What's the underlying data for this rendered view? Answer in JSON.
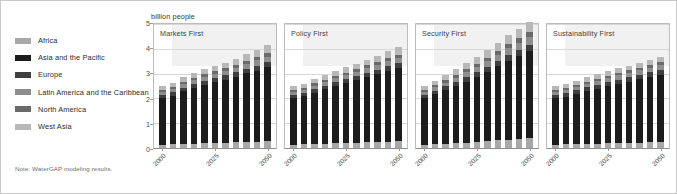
{
  "figure": {
    "axis_title": "billion people",
    "note": "Note: WaterGAP modeling results."
  },
  "legend": {
    "items": [
      {
        "label": "Africa",
        "color": "#a8a8a8"
      },
      {
        "label": "Asia and the Pacific",
        "color": "#1c1c1c"
      },
      {
        "label": "Europe",
        "color": "#3f3f3f"
      },
      {
        "label": "Latin America and the Caribbean",
        "color": "#8e8e8e"
      },
      {
        "label": "North America",
        "color": "#6a6a6a"
      },
      {
        "label": "West Asia",
        "color": "#b8b8b8"
      }
    ]
  },
  "chart_data": {
    "type": "bar",
    "title": "",
    "subtitle": "",
    "xlabel": "",
    "ylabel": "billion people",
    "ylim": [
      0,
      5
    ],
    "yticks": [
      0,
      1,
      2,
      3,
      4,
      5
    ],
    "grid": true,
    "legend_position": "left",
    "stacked": true,
    "x": [
      2000,
      2005,
      2010,
      2015,
      2020,
      2025,
      2030,
      2035,
      2040,
      2045,
      2050
    ],
    "xtick_labels": [
      "2000",
      "2025",
      "2050"
    ],
    "xtick_positions": [
      2000,
      2025,
      2050
    ],
    "series_names": [
      "Africa",
      "Asia and the Pacific",
      "Europe",
      "Latin America and the Caribbean",
      "North America",
      "West Asia"
    ],
    "panels": [
      {
        "title": "Markets First",
        "totals": [
          2.5,
          2.62,
          2.85,
          3.02,
          3.18,
          3.32,
          3.45,
          3.6,
          3.78,
          3.95,
          4.15
        ],
        "series": [
          {
            "name": "Africa",
            "values": [
              0.14,
              0.15,
              0.17,
              0.18,
              0.2,
              0.21,
              0.22,
              0.23,
              0.25,
              0.26,
              0.28
            ]
          },
          {
            "name": "Asia and the Pacific",
            "values": [
              1.86,
              1.95,
              2.12,
              2.25,
              2.36,
              2.46,
              2.54,
              2.64,
              2.76,
              2.86,
              2.98
            ]
          },
          {
            "name": "Europe",
            "values": [
              0.14,
              0.14,
              0.15,
              0.15,
              0.16,
              0.16,
              0.17,
              0.18,
              0.19,
              0.2,
              0.21
            ]
          },
          {
            "name": "Latin America and the Caribbean",
            "values": [
              0.12,
              0.13,
              0.14,
              0.15,
              0.16,
              0.17,
              0.18,
              0.19,
              0.2,
              0.21,
              0.22
            ]
          },
          {
            "name": "North America",
            "values": [
              0.08,
              0.08,
              0.09,
              0.09,
              0.1,
              0.1,
              0.11,
              0.11,
              0.12,
              0.13,
              0.14
            ]
          },
          {
            "name": "West Asia",
            "values": [
              0.16,
              0.17,
              0.18,
              0.2,
              0.2,
              0.22,
              0.23,
              0.25,
              0.26,
              0.29,
              0.32
            ]
          }
        ]
      },
      {
        "title": "Policy First",
        "totals": [
          2.5,
          2.6,
          2.78,
          2.95,
          3.1,
          3.25,
          3.4,
          3.55,
          3.72,
          3.9,
          4.08
        ],
        "series": [
          {
            "name": "Africa",
            "values": [
              0.14,
              0.15,
              0.16,
              0.17,
              0.19,
              0.2,
              0.21,
              0.23,
              0.24,
              0.26,
              0.27
            ]
          },
          {
            "name": "Asia and the Pacific",
            "values": [
              1.86,
              1.94,
              2.07,
              2.2,
              2.3,
              2.41,
              2.52,
              2.62,
              2.73,
              2.85,
              2.95
            ]
          },
          {
            "name": "Europe",
            "values": [
              0.14,
              0.14,
              0.15,
              0.15,
              0.16,
              0.16,
              0.17,
              0.18,
              0.19,
              0.19,
              0.2
            ]
          },
          {
            "name": "Latin America and the Caribbean",
            "values": [
              0.12,
              0.13,
              0.14,
              0.15,
              0.16,
              0.17,
              0.18,
              0.19,
              0.2,
              0.21,
              0.22
            ]
          },
          {
            "name": "North America",
            "values": [
              0.08,
              0.08,
              0.09,
              0.09,
              0.1,
              0.1,
              0.11,
              0.11,
              0.12,
              0.13,
              0.13
            ]
          },
          {
            "name": "West Asia",
            "values": [
              0.16,
              0.16,
              0.17,
              0.19,
              0.19,
              0.21,
              0.21,
              0.22,
              0.24,
              0.26,
              0.31
            ]
          }
        ]
      },
      {
        "title": "Security First",
        "totals": [
          2.5,
          2.72,
          2.95,
          3.18,
          3.42,
          3.68,
          3.95,
          4.25,
          4.55,
          4.82,
          5.1
        ],
        "series": [
          {
            "name": "Africa",
            "values": [
              0.14,
              0.16,
              0.18,
              0.2,
              0.22,
              0.25,
              0.28,
              0.31,
              0.34,
              0.37,
              0.4
            ]
          },
          {
            "name": "Asia and the Pacific",
            "values": [
              1.86,
              2.0,
              2.15,
              2.3,
              2.46,
              2.62,
              2.8,
              2.99,
              3.18,
              3.35,
              3.52
            ]
          },
          {
            "name": "Europe",
            "values": [
              0.14,
              0.15,
              0.16,
              0.17,
              0.18,
              0.19,
              0.2,
              0.21,
              0.23,
              0.24,
              0.25
            ]
          },
          {
            "name": "Latin America and the Caribbean",
            "values": [
              0.12,
              0.14,
              0.15,
              0.17,
              0.19,
              0.21,
              0.23,
              0.25,
              0.27,
              0.29,
              0.32
            ]
          },
          {
            "name": "North America",
            "values": [
              0.08,
              0.09,
              0.1,
              0.11,
              0.12,
              0.13,
              0.14,
              0.16,
              0.17,
              0.18,
              0.2
            ]
          },
          {
            "name": "West Asia",
            "values": [
              0.16,
              0.18,
              0.21,
              0.23,
              0.25,
              0.28,
              0.3,
              0.33,
              0.36,
              0.39,
              0.41
            ]
          }
        ]
      },
      {
        "title": "Sustainability First",
        "totals": [
          2.5,
          2.58,
          2.72,
          2.85,
          2.98,
          3.1,
          3.22,
          3.32,
          3.45,
          3.56,
          3.68
        ],
        "series": [
          {
            "name": "Africa",
            "values": [
              0.14,
              0.15,
              0.16,
              0.17,
              0.18,
              0.19,
              0.2,
              0.21,
              0.22,
              0.23,
              0.24
            ]
          },
          {
            "name": "Asia and the Pacific",
            "values": [
              1.86,
              1.92,
              2.03,
              2.13,
              2.22,
              2.31,
              2.4,
              2.47,
              2.56,
              2.64,
              2.72
            ]
          },
          {
            "name": "Europe",
            "values": [
              0.14,
              0.14,
              0.14,
              0.15,
              0.15,
              0.16,
              0.16,
              0.17,
              0.17,
              0.18,
              0.18
            ]
          },
          {
            "name": "Latin America and the Caribbean",
            "values": [
              0.12,
              0.13,
              0.14,
              0.14,
              0.15,
              0.16,
              0.17,
              0.17,
              0.18,
              0.19,
              0.2
            ]
          },
          {
            "name": "North America",
            "values": [
              0.08,
              0.08,
              0.09,
              0.09,
              0.1,
              0.1,
              0.1,
              0.11,
              0.11,
              0.12,
              0.12
            ]
          },
          {
            "name": "West Asia",
            "values": [
              0.16,
              0.16,
              0.16,
              0.17,
              0.18,
              0.18,
              0.19,
              0.19,
              0.21,
              0.2,
              0.22
            ]
          }
        ]
      }
    ]
  }
}
